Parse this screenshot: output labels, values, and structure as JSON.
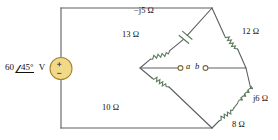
{
  "figure": {
    "type": "circuit-schematic",
    "wire_color": "#5a5f63",
    "component_color": "#5d7a5d",
    "source_fill": "#f2d98a",
    "source_stroke": "#b08a2e",
    "text_color": "#111111"
  },
  "source": {
    "name": "voltage-source",
    "magnitude": "60",
    "angle": "45",
    "angle_symbol": "∠",
    "degree": "°",
    "unit": "V",
    "label": "60 ∠45° V",
    "plus": "+",
    "minus": "−"
  },
  "components": {
    "upper_left_resistor": {
      "name": "resistor-13-ohm",
      "label": "13 Ω"
    },
    "upper_left_capacitor": {
      "name": "capacitor-neg-j5-ohm",
      "label": "−j5 Ω"
    },
    "upper_right_resistor": {
      "name": "resistor-12-ohm",
      "label": "12 Ω"
    },
    "lower_left_resistor": {
      "name": "resistor-10-ohm",
      "label": "10 Ω"
    },
    "lower_right_resistor": {
      "name": "resistor-8-ohm",
      "label": "8 Ω"
    },
    "lower_right_inductor": {
      "name": "inductor-j6-ohm",
      "label": "j6 Ω"
    }
  },
  "terminals": {
    "a": {
      "name": "terminal-a",
      "label": "a"
    },
    "b": {
      "name": "terminal-b",
      "label": "b"
    }
  }
}
